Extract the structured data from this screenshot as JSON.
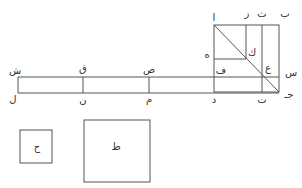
{
  "diagram": {
    "type": "geometric-construction",
    "stroke_color": "#555555",
    "labels": {
      "alif": "ا",
      "ba": "ب",
      "tha": "ث",
      "zay": "ز",
      "ha": "ه",
      "kaf": "ك",
      "ain": "ع",
      "sin": "س",
      "fa": "ف",
      "jim": "جـ",
      "ta": "ت",
      "dal": "د",
      "sad": "ص",
      "qaf": "ق",
      "shin": "ش",
      "mim": "م",
      "nun": "ن",
      "lam": "ل",
      "hha": "ح",
      "tta": "ط"
    }
  }
}
